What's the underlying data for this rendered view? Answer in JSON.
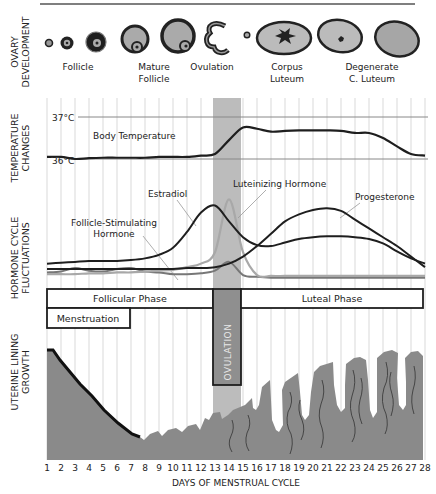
{
  "rows": {
    "ovary": "OVARY|DEVELOPMENT",
    "temperature": "TEMPERATURE|CHANGES",
    "hormone": "HORMONE CYCLE|FLUCTUATIONS",
    "uterine": "UTERINE LINING|GROWTH"
  },
  "ovary_stages": [
    {
      "label": "Follicle",
      "x": 78
    },
    {
      "label": "Mature|Follicle",
      "x": 154
    },
    {
      "label": "Ovulation",
      "x": 212
    },
    {
      "label": "Corpus|Luteum",
      "x": 287
    },
    {
      "label": "Degenerate|C. Luteum",
      "x": 372
    }
  ],
  "temperature": {
    "high_label": "37°C",
    "low_label": "36°C",
    "series_label": "Body Temperature"
  },
  "hormones": {
    "estradiol": "Estradiol",
    "lh": "Luteinizing Hormone",
    "fsh": "Follicle-Stimulating|Hormone",
    "progesterone": "Progesterone"
  },
  "phases": {
    "follicular": "Follicular Phase",
    "menstruation": "Menstruation",
    "ovulation": "OVULATION",
    "luteal": "Luteal Phase"
  },
  "x_axis": {
    "title": "DAYS OF MENSTRUAL CYCLE",
    "ticks": [
      "1",
      "2",
      "3",
      "4",
      "5",
      "6",
      "7",
      "8",
      "9",
      "10",
      "11",
      "12",
      "13",
      "14",
      "15",
      "16",
      "17",
      "18",
      "19",
      "20",
      "21",
      "22",
      "23",
      "24",
      "25",
      "26",
      "27",
      "28"
    ]
  },
  "colors": {
    "grid": "#cfcfcf",
    "ovulation_band": "#b9b9b9",
    "line_dark": "#1e1e1e",
    "line_gray": "#a8a8a8",
    "lining": "#8a8a8a",
    "ovulation_box": "#8f8f8f"
  },
  "chart_data": {
    "type": "line",
    "title": "Menstrual Cycle",
    "xlabel": "DAYS OF MENSTRUAL CYCLE",
    "x": [
      1,
      2,
      3,
      4,
      5,
      6,
      7,
      8,
      9,
      10,
      11,
      12,
      13,
      14,
      15,
      16,
      17,
      18,
      19,
      20,
      21,
      22,
      23,
      24,
      25,
      26,
      27,
      28
    ],
    "series": [
      {
        "name": "Body Temperature (°C)",
        "values": [
          36.05,
          36.05,
          36.0,
          36.02,
          36.03,
          36.03,
          36.03,
          36.03,
          36.05,
          36.05,
          36.05,
          36.08,
          36.12,
          36.45,
          36.75,
          36.72,
          36.65,
          36.67,
          36.68,
          36.68,
          36.68,
          36.67,
          36.62,
          36.62,
          36.5,
          36.3,
          36.12,
          36.08
        ]
      },
      {
        "name": "Estradiol",
        "values": [
          0.22,
          0.23,
          0.24,
          0.25,
          0.25,
          0.25,
          0.26,
          0.28,
          0.32,
          0.4,
          0.58,
          0.8,
          0.88,
          0.7,
          0.52,
          0.43,
          0.42,
          0.46,
          0.5,
          0.52,
          0.53,
          0.53,
          0.52,
          0.5,
          0.45,
          0.36,
          0.28,
          0.22
        ]
      },
      {
        "name": "Luteinizing Hormone",
        "values": [
          0.1,
          0.1,
          0.1,
          0.11,
          0.11,
          0.12,
          0.12,
          0.13,
          0.14,
          0.15,
          0.18,
          0.22,
          0.35,
          0.95,
          0.35,
          0.09,
          0.08,
          0.08,
          0.08,
          0.08,
          0.08,
          0.08,
          0.08,
          0.08,
          0.08,
          0.08,
          0.08,
          0.08
        ]
      },
      {
        "name": "Follicle-Stimulating Hormone",
        "values": [
          0.12,
          0.13,
          0.17,
          0.14,
          0.13,
          0.16,
          0.17,
          0.13,
          0.12,
          0.1,
          0.1,
          0.11,
          0.14,
          0.24,
          0.09,
          0.07,
          0.06,
          0.06,
          0.06,
          0.06,
          0.06,
          0.06,
          0.06,
          0.06,
          0.06,
          0.06,
          0.06,
          0.06
        ]
      },
      {
        "name": "Progesterone",
        "values": [
          0.16,
          0.16,
          0.16,
          0.16,
          0.16,
          0.16,
          0.16,
          0.16,
          0.16,
          0.16,
          0.17,
          0.17,
          0.18,
          0.22,
          0.3,
          0.42,
          0.56,
          0.7,
          0.78,
          0.83,
          0.85,
          0.82,
          0.72,
          0.62,
          0.52,
          0.42,
          0.3,
          0.18
        ]
      }
    ],
    "annotations": [
      "Follicular Phase: days 1-13",
      "Menstruation: days 1-7",
      "Ovulation: days 13-15",
      "Luteal Phase: days 15-28"
    ],
    "ylim_temperature": [
      36,
      37
    ]
  }
}
